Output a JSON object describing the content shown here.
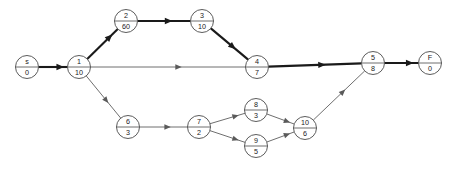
{
  "diagram": {
    "type": "activity-on-node-network",
    "title": "",
    "width": 451,
    "height": 177,
    "colors": {
      "background": "#ffffff",
      "node_stroke": "#4a4a4a",
      "node_fill": "#ffffff",
      "edge_normal": "#6f6f6f",
      "edge_critical": "#1a1a1a",
      "text": "#1a1a1a"
    },
    "nodes": [
      {
        "id": "s",
        "label": "s",
        "value": "0",
        "cx": 27,
        "cy": 67
      },
      {
        "id": "1",
        "label": "1",
        "value": "10",
        "cx": 79,
        "cy": 67
      },
      {
        "id": "2",
        "label": "2",
        "value": "60",
        "cx": 126,
        "cy": 21
      },
      {
        "id": "3",
        "label": "3",
        "value": "10",
        "cx": 202,
        "cy": 21
      },
      {
        "id": "4",
        "label": "4",
        "value": "7",
        "cx": 257,
        "cy": 67
      },
      {
        "id": "5",
        "label": "5",
        "value": "8",
        "cx": 373,
        "cy": 63
      },
      {
        "id": "F",
        "label": "F",
        "value": "0",
        "cx": 430,
        "cy": 63
      },
      {
        "id": "6",
        "label": "6",
        "value": "3",
        "cx": 128,
        "cy": 127
      },
      {
        "id": "7",
        "label": "7",
        "value": "2",
        "cx": 199,
        "cy": 127
      },
      {
        "id": "8",
        "label": "8",
        "value": "3",
        "cx": 256,
        "cy": 110
      },
      {
        "id": "9",
        "label": "9",
        "value": "5",
        "cx": 256,
        "cy": 146
      },
      {
        "id": "10",
        "label": "10",
        "value": "6",
        "cx": 305,
        "cy": 128
      }
    ],
    "edges": [
      {
        "from": "s",
        "to": "1",
        "critical": true
      },
      {
        "from": "1",
        "to": "2",
        "critical": true
      },
      {
        "from": "2",
        "to": "3",
        "critical": true
      },
      {
        "from": "3",
        "to": "4",
        "critical": true
      },
      {
        "from": "1",
        "to": "4",
        "critical": false
      },
      {
        "from": "4",
        "to": "5",
        "critical": true
      },
      {
        "from": "5",
        "to": "F",
        "critical": true
      },
      {
        "from": "1",
        "to": "6",
        "critical": false
      },
      {
        "from": "6",
        "to": "7",
        "critical": false
      },
      {
        "from": "7",
        "to": "8",
        "critical": false
      },
      {
        "from": "7",
        "to": "9",
        "critical": false
      },
      {
        "from": "8",
        "to": "10",
        "critical": false
      },
      {
        "from": "9",
        "to": "10",
        "critical": false
      },
      {
        "from": "10",
        "to": "5",
        "critical": false
      }
    ],
    "node_radius": 11.5
  }
}
